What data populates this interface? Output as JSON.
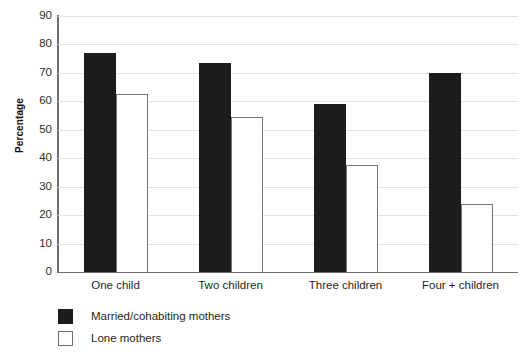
{
  "chart_data": {
    "type": "bar",
    "title": "",
    "xlabel": "",
    "ylabel": "Percentage",
    "ylim": [
      0,
      90
    ],
    "ytick_step": 10,
    "yticks": [
      90,
      80,
      70,
      60,
      50,
      40,
      30,
      20,
      10,
      0
    ],
    "grid": "horizontal",
    "legend_position": "below-left",
    "categories": [
      "One child",
      "Two children",
      "Three children",
      "Four + children"
    ],
    "series": [
      {
        "name": "Married/cohabiting mothers",
        "color": "#1c1c1c",
        "fill": "solid-black",
        "values": [
          77,
          73.5,
          59,
          70
        ]
      },
      {
        "name": "Lone mothers",
        "color": "#ffffff",
        "fill": "white-outlined",
        "values": [
          62.5,
          54.5,
          37.5,
          24
        ]
      }
    ]
  },
  "axis": {
    "y_title": "Percentage"
  },
  "colors": {
    "series_dark": "#1c1c1c",
    "series_light": "#ffffff",
    "gridline": "#e2e2e2",
    "axis_line": "#6e6e6e",
    "text": "#1f1f1f"
  }
}
